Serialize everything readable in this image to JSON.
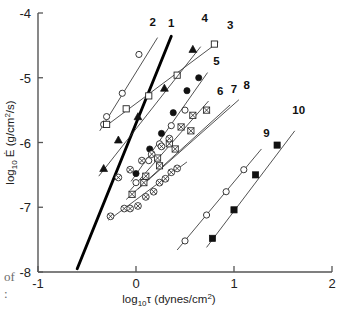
{
  "chart_data": {
    "type": "scatter",
    "title": "",
    "xlabel": "log10 τ (dynes/cm2)",
    "ylabel": "log10 Ė (g/cm2/s)",
    "xlabel_parts": {
      "pre": "log",
      "sub": "10",
      "sym": "τ",
      "unit_pre": " (dynes/cm",
      "unit_sup": "2",
      "unit_post": ")"
    },
    "ylabel_parts": {
      "pre": "log",
      "sub": "10",
      "sym": "Ė",
      "unit_pre": " (g/cm",
      "unit_sup": "2",
      "unit_post": "/s)"
    },
    "xlim": [
      -1,
      2
    ],
    "ylim": [
      -8,
      -4
    ],
    "xticks": [
      -1,
      0,
      1,
      2
    ],
    "xticklabels": [
      "-1",
      "0",
      "1",
      "2"
    ],
    "yticks": [
      -4,
      -5,
      -6,
      -7,
      -8
    ],
    "yticklabels": [
      "-4",
      "-5",
      "-6",
      "-7",
      "-8"
    ],
    "grid": false,
    "legend_position": "inline-numbered-labels",
    "series": [
      {
        "name": "1",
        "marker": "none",
        "style": "thick-line",
        "label": "1",
        "label_at": [
          0.36,
          -4.22
        ],
        "trend": [
          [
            -0.6,
            -7.95
          ],
          [
            0.36,
            -4.36
          ]
        ],
        "points": []
      },
      {
        "name": "2",
        "marker": "circle-open",
        "style": "line",
        "label": "2",
        "label_at": [
          0.17,
          -4.2
        ],
        "trend": [
          [
            -0.37,
            -5.82
          ],
          [
            0.22,
            -4.38
          ]
        ],
        "points": [
          [
            -0.3,
            -5.6
          ],
          [
            -0.33,
            -5.72
          ],
          [
            -0.14,
            -5.24
          ],
          [
            0.03,
            -4.64
          ]
        ]
      },
      {
        "name": "3",
        "marker": "square-open",
        "style": "line",
        "label": "3",
        "label_at": [
          0.96,
          -4.24
        ],
        "trend": [
          [
            -0.32,
            -5.76
          ],
          [
            0.84,
            -4.45
          ]
        ],
        "points": [
          [
            -0.3,
            -5.72
          ],
          [
            -0.1,
            -5.48
          ],
          [
            0.13,
            -5.28
          ],
          [
            0.42,
            -4.96
          ],
          [
            0.8,
            -4.48
          ]
        ]
      },
      {
        "name": "4",
        "marker": "triangle-fill",
        "style": "line",
        "label": "4",
        "label_at": [
          0.7,
          -4.14
        ],
        "trend": [
          [
            -0.38,
            -6.52
          ],
          [
            0.66,
            -4.52
          ]
        ],
        "points": [
          [
            -0.33,
            -6.4
          ],
          [
            -0.18,
            -5.96
          ],
          [
            0.02,
            -5.6
          ],
          [
            0.29,
            -5.16
          ],
          [
            0.58,
            -4.56
          ]
        ]
      },
      {
        "name": "5",
        "marker": "circle-fill",
        "style": "line",
        "label": "5",
        "label_at": [
          0.82,
          -4.8
        ],
        "trend": [
          [
            -0.05,
            -6.6
          ],
          [
            0.73,
            -4.92
          ]
        ],
        "points": [
          [
            0.0,
            -6.48
          ],
          [
            0.14,
            -6.1
          ],
          [
            0.26,
            -5.86
          ],
          [
            0.38,
            -5.54
          ],
          [
            0.52,
            -5.2
          ],
          [
            0.64,
            -5.0
          ]
        ]
      },
      {
        "name": "6",
        "marker": "circle-open",
        "style": "line",
        "label": "6",
        "label_at": [
          0.86,
          -5.26
        ],
        "trend": [
          [
            -0.06,
            -6.74
          ],
          [
            0.74,
            -5.36
          ]
        ],
        "points": [
          [
            0.0,
            -6.62
          ],
          [
            0.13,
            -6.28
          ],
          [
            0.24,
            -6.02
          ],
          [
            0.36,
            -5.74
          ],
          [
            0.5,
            -5.5
          ]
        ]
      },
      {
        "name": "7",
        "marker": "square-cross",
        "style": "line",
        "label": "7",
        "label_at": [
          1.0,
          -5.24
        ],
        "trend": [
          [
            -0.1,
            -6.88
          ],
          [
            0.96,
            -5.42
          ]
        ],
        "points": [
          [
            -0.04,
            -6.8
          ],
          [
            0.1,
            -6.52
          ],
          [
            0.22,
            -6.24
          ],
          [
            0.34,
            -6.02
          ],
          [
            0.46,
            -5.76
          ],
          [
            0.58,
            -5.58
          ]
        ]
      },
      {
        "name": "8",
        "marker": "square-cross",
        "style": "line",
        "label": "8",
        "label_at": [
          1.13,
          -5.18
        ],
        "trend": [
          [
            0.02,
            -6.72
          ],
          [
            1.05,
            -5.34
          ]
        ],
        "points": [
          [
            0.08,
            -6.62
          ],
          [
            0.24,
            -6.36
          ],
          [
            0.4,
            -6.1
          ],
          [
            0.56,
            -5.82
          ],
          [
            0.72,
            -5.5
          ]
        ]
      },
      {
        "name": "9",
        "marker": "circle-open",
        "style": "line",
        "label": "9",
        "label_at": [
          1.33,
          -5.92
        ],
        "trend": [
          [
            0.42,
            -7.66
          ],
          [
            1.28,
            -6.1
          ]
        ],
        "points": [
          [
            0.5,
            -7.52
          ],
          [
            0.72,
            -7.12
          ],
          [
            0.92,
            -6.76
          ],
          [
            1.1,
            -6.42
          ]
        ]
      },
      {
        "name": "10",
        "marker": "square-fill",
        "style": "line",
        "label": "10",
        "label_at": [
          1.66,
          -5.56
        ],
        "trend": [
          [
            0.72,
            -7.62
          ],
          [
            1.62,
            -5.82
          ]
        ],
        "points": [
          [
            0.78,
            -7.48
          ],
          [
            1.0,
            -7.04
          ],
          [
            1.22,
            -6.5
          ],
          [
            1.44,
            -6.04
          ]
        ]
      },
      {
        "name": "crossed-circles-cluster",
        "marker": "circle-cross",
        "style": "line",
        "label": "",
        "label_at": null,
        "trend": [
          [
            -0.28,
            -7.2
          ],
          [
            0.52,
            -6.3
          ]
        ],
        "points": [
          [
            -0.26,
            -7.14
          ],
          [
            -0.12,
            -7.02
          ],
          [
            -0.06,
            -7.02
          ],
          [
            0.02,
            -6.98
          ],
          [
            0.1,
            -6.84
          ],
          [
            0.18,
            -6.76
          ],
          [
            0.24,
            -6.62
          ],
          [
            0.3,
            -6.56
          ],
          [
            0.36,
            -6.46
          ],
          [
            0.42,
            -6.4
          ],
          [
            -0.18,
            -6.54
          ],
          [
            -0.06,
            -6.42
          ],
          [
            0.06,
            -6.28
          ],
          [
            0.16,
            -6.18
          ],
          [
            0.26,
            -6.06
          ],
          [
            0.34,
            -5.94
          ]
        ]
      }
    ]
  },
  "page_artifacts": {
    "left_word": "of",
    "left_colon": ":"
  }
}
